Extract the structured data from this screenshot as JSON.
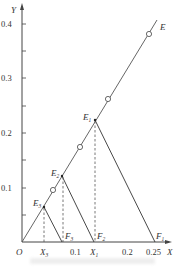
{
  "diagram": {
    "type": "graphical-stagewise-construction",
    "axes": {
      "x_label": "X",
      "y_label": "Y",
      "origin_label": "O",
      "x_ticks": [
        {
          "value": 0.1,
          "label": "0.1"
        },
        {
          "value": 0.2,
          "label": "0.2"
        },
        {
          "value": 0.25,
          "label": "0.25"
        }
      ],
      "y_ticks": [
        {
          "value": 0.1,
          "label": "0.1"
        },
        {
          "value": 0.2,
          "label": "0.2"
        },
        {
          "value": 0.3,
          "label": "0.3"
        },
        {
          "value": 0.4,
          "label": "0.4"
        }
      ],
      "y_minor_ticks": [
        0.05,
        0.15,
        0.25,
        0.35
      ]
    },
    "equilibrium_line": {
      "label": "E",
      "from": [
        0,
        0
      ],
      "to": [
        0.255,
        0.41
      ]
    },
    "equilibrium_points": [
      {
        "label": "E",
        "sub": "1",
        "x": 0.136,
        "y": 0.224
      },
      {
        "label": "E",
        "sub": "2",
        "x": 0.075,
        "y": 0.122
      },
      {
        "label": "E",
        "sub": "3",
        "x": 0.041,
        "y": 0.065
      }
    ],
    "feed_points": [
      {
        "label": "F",
        "sub": "1",
        "x": 0.25
      },
      {
        "label": "F",
        "sub": "2",
        "x": 0.136
      },
      {
        "label": "F",
        "sub": "3",
        "x": 0.075
      }
    ],
    "x_markers": [
      {
        "label": "X",
        "sub": "1",
        "x": 0.136
      },
      {
        "label": "X",
        "sub": "3",
        "x": 0.041
      }
    ],
    "open_circles": [
      {
        "x": 0.058,
        "y": 0.095
      },
      {
        "x": 0.109,
        "y": 0.175
      },
      {
        "x": 0.162,
        "y": 0.263
      },
      {
        "x": 0.239,
        "y": 0.381
      }
    ]
  }
}
